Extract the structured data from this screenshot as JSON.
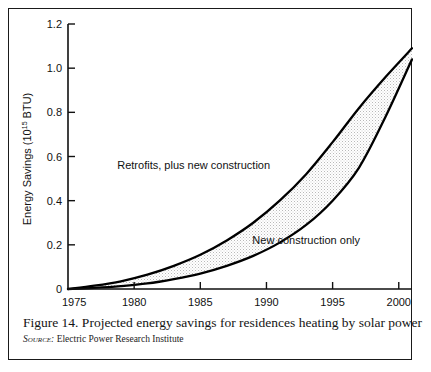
{
  "figure": {
    "caption": "Figure 14. Projected energy savings for residences heating by solar power",
    "source_label": "Source:",
    "source_text": "Electric Power Research Institute"
  },
  "chart_data": {
    "type": "area",
    "title": "",
    "xlabel": "",
    "ylabel": "Energy Savings (10",
    "ylabel_exponent": "15",
    "ylabel_suffix": " BTU)",
    "xlim": [
      1975,
      2001
    ],
    "ylim": [
      0,
      1.2
    ],
    "xticks": [
      1975,
      1980,
      1985,
      1990,
      1995,
      2000
    ],
    "xtick_labels": [
      "1975",
      "1980",
      "1985",
      "1990",
      "1995",
      "2000"
    ],
    "yticks": [
      0,
      0.2,
      0.4,
      0.6,
      0.8,
      1.0,
      1.2
    ],
    "ytick_labels": [
      "0",
      "0.2",
      "0.4",
      "0.6",
      "0.8",
      "1.0",
      "1.2"
    ],
    "grid": false,
    "legend_position": "inline-annotations",
    "x": [
      1975,
      1977,
      1979,
      1981,
      1983,
      1985,
      1987,
      1989,
      1991,
      1993,
      1995,
      1997,
      1999,
      2001
    ],
    "series": [
      {
        "name": "Retrofits, plus new construction",
        "label_x": 1984.5,
        "label_y": 0.545,
        "values": [
          0.0,
          0.015,
          0.035,
          0.065,
          0.105,
          0.155,
          0.22,
          0.3,
          0.4,
          0.52,
          0.665,
          0.82,
          0.96,
          1.09
        ]
      },
      {
        "name": "New construction only",
        "label_x": 1993.0,
        "label_y": 0.205,
        "values": [
          0.0,
          0.005,
          0.013,
          0.025,
          0.045,
          0.07,
          0.105,
          0.15,
          0.21,
          0.29,
          0.4,
          0.55,
          0.78,
          1.04
        ]
      }
    ],
    "band_fill_color": "#ebebeb",
    "line_color": "#000000",
    "axis_color": "#111111"
  }
}
